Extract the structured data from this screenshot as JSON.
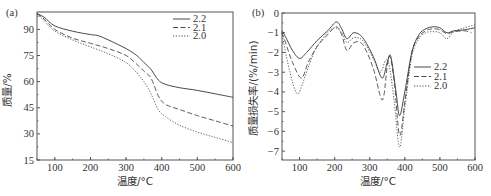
{
  "chart_data": [
    {
      "panel": "(a)",
      "type": "line",
      "title": "",
      "xlabel": "温度/°C",
      "ylabel": "质量/%",
      "xlim": [
        50,
        600
      ],
      "ylim": [
        15,
        100
      ],
      "xticks": [
        100,
        200,
        300,
        400,
        500,
        600
      ],
      "yticks": [
        15,
        30,
        45,
        60,
        75,
        90
      ],
      "grid": false,
      "legend_position": "upper right",
      "series": [
        {
          "name": "2.2",
          "style": "solid",
          "x": [
            50,
            70,
            100,
            150,
            200,
            220,
            250,
            300,
            330,
            350,
            370,
            390,
            410,
            450,
            500,
            550,
            600
          ],
          "y": [
            99,
            97,
            92,
            89,
            87,
            86.5,
            84,
            79,
            75,
            71,
            67,
            61,
            58.5,
            56.5,
            55,
            53,
            51
          ]
        },
        {
          "name": "2.1",
          "style": "dashed",
          "x": [
            50,
            70,
            100,
            150,
            200,
            250,
            300,
            330,
            350,
            370,
            390,
            410,
            450,
            500,
            550,
            600
          ],
          "y": [
            99,
            96,
            90,
            85,
            82,
            79,
            75,
            70,
            66,
            62,
            52,
            47,
            44,
            40.5,
            37.5,
            34.5
          ]
        },
        {
          "name": "2.0",
          "style": "dotted",
          "x": [
            50,
            70,
            100,
            150,
            200,
            250,
            300,
            330,
            350,
            370,
            390,
            410,
            450,
            500,
            550,
            600
          ],
          "y": [
            99,
            95,
            89,
            84,
            80,
            76,
            71,
            65,
            60,
            53,
            44,
            40,
            35,
            31,
            28,
            25
          ]
        }
      ]
    },
    {
      "panel": "(b)",
      "type": "line",
      "title": "",
      "xlabel": "温度/°C",
      "ylabel": "质量损失率/(%/min)",
      "xlim": [
        50,
        600
      ],
      "ylim": [
        -7.45,
        0
      ],
      "xticks": [
        100,
        200,
        300,
        400,
        500,
        600
      ],
      "yticks": [
        0,
        -1,
        -2,
        -3,
        -4,
        -5,
        -6,
        -7
      ],
      "grid": false,
      "legend_position": "center right",
      "series": [
        {
          "name": "2.2",
          "style": "solid",
          "x": [
            50,
            60,
            80,
            100,
            120,
            150,
            180,
            205,
            220,
            235,
            255,
            280,
            310,
            335,
            350,
            360,
            375,
            385,
            400,
            420,
            440,
            460,
            480,
            500,
            520,
            540,
            570,
            600
          ],
          "y": [
            -0.9,
            -1.2,
            -1.9,
            -2.3,
            -2.0,
            -1.4,
            -0.9,
            -0.45,
            -0.8,
            -1.3,
            -1.0,
            -1.25,
            -2.2,
            -3.3,
            -2.5,
            -2.2,
            -4.0,
            -5.2,
            -4.0,
            -2.0,
            -1.1,
            -0.8,
            -0.7,
            -0.75,
            -1.0,
            -0.9,
            -0.85,
            -0.75
          ]
        },
        {
          "name": "2.1",
          "style": "dashed",
          "x": [
            50,
            60,
            80,
            105,
            125,
            150,
            180,
            205,
            220,
            235,
            255,
            280,
            310,
            330,
            340,
            355,
            370,
            385,
            400,
            420,
            440,
            460,
            480,
            500,
            520,
            540,
            570,
            590
          ],
          "y": [
            -1.0,
            -1.5,
            -2.5,
            -3.3,
            -2.5,
            -1.7,
            -1.1,
            -0.7,
            -1.1,
            -1.9,
            -1.5,
            -1.6,
            -2.8,
            -4.2,
            -4.2,
            -2.2,
            -3.5,
            -6.2,
            -4.5,
            -2.0,
            -1.2,
            -0.9,
            -0.8,
            -0.85,
            -1.05,
            -0.95,
            -0.9,
            -1.0
          ]
        },
        {
          "name": "2.0",
          "style": "dotted",
          "x": [
            50,
            60,
            80,
            95,
            110,
            130,
            150,
            180,
            200,
            220,
            235,
            255,
            280,
            310,
            330,
            345,
            355,
            370,
            385,
            400,
            420,
            440,
            460,
            480,
            500,
            520,
            540,
            570,
            600
          ],
          "y": [
            -1.0,
            -2.0,
            -3.5,
            -4.1,
            -3.5,
            -2.5,
            -1.7,
            -1.0,
            -0.75,
            -1.0,
            -1.5,
            -1.25,
            -1.4,
            -2.3,
            -3.0,
            -2.4,
            -2.6,
            -4.5,
            -6.8,
            -4.8,
            -2.2,
            -1.3,
            -1.0,
            -0.95,
            -1.0,
            -1.3,
            -0.95,
            -0.75,
            -0.6
          ]
        }
      ]
    }
  ],
  "panels": {
    "a": {
      "label": "(a)",
      "xlabel": "温度/°C",
      "ylabel": "质量/%",
      "xtick_labels": [
        "100",
        "200",
        "300",
        "400",
        "500",
        "600"
      ],
      "ytick_labels": [
        "90",
        "75",
        "60",
        "45",
        "30",
        "15"
      ],
      "legend": [
        "2.2",
        "2.1",
        "2.0"
      ]
    },
    "b": {
      "label": "(b)",
      "xlabel": "温度/°C",
      "ylabel": "质量损失率/(%/min)",
      "xtick_labels": [
        "100",
        "200",
        "300",
        "400",
        "500",
        "600"
      ],
      "ytick_labels": [
        "0",
        "-1",
        "-2",
        "-3",
        "-4",
        "-5",
        "-6",
        "-7"
      ],
      "legend": [
        "2.2",
        "2.1",
        "2.0"
      ]
    }
  },
  "colors": {
    "axis": "#555555",
    "line": "#333333"
  }
}
